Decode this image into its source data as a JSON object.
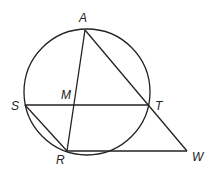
{
  "diagram": {
    "type": "geometry",
    "points": {
      "A": {
        "label": "A",
        "x": 85,
        "y": 30
      },
      "S": {
        "label": "S",
        "x": 25,
        "y": 105
      },
      "M": {
        "label": "M",
        "x": 73,
        "y": 105
      },
      "T": {
        "label": "T",
        "x": 148,
        "y": 105
      },
      "R": {
        "label": "R",
        "x": 67,
        "y": 151
      },
      "W": {
        "label": "W",
        "x": 187,
        "y": 151
      }
    },
    "circle": {
      "cx": 87,
      "cy": 92,
      "r": 63
    },
    "segments": [
      "AR",
      "AW",
      "ST",
      "SR",
      "RW"
    ]
  }
}
